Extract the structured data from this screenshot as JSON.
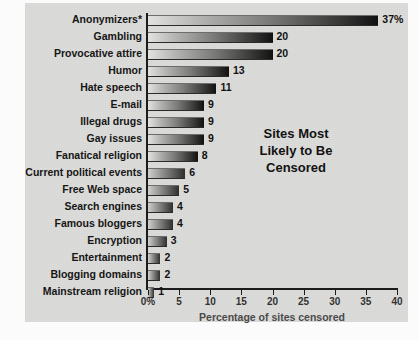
{
  "chart_data": {
    "type": "bar",
    "orientation": "horizontal",
    "title_lines": [
      "Sites Most",
      "Likely to Be",
      "Censored"
    ],
    "xlabel": "Percentage of sites censored",
    "ylabel": "",
    "xlim": [
      0,
      40
    ],
    "xticks": [
      0,
      5,
      10,
      15,
      20,
      25,
      30,
      35,
      40
    ],
    "xticklabels": [
      "0%",
      "5",
      "10",
      "15",
      "20",
      "25",
      "30",
      "35",
      "40"
    ],
    "grid": false,
    "legend": null,
    "categories": [
      "Anonymizers*",
      "Gambling",
      "Provocative attire",
      "Humor",
      "Hate speech",
      "E-mail",
      "Illegal drugs",
      "Gay issues",
      "Fanatical religion",
      "Current political events",
      "Free Web space",
      "Search engines",
      "Famous bloggers",
      "Encryption",
      "Entertainment",
      "Blogging domains",
      "Mainstream religion"
    ],
    "values": [
      37,
      20,
      20,
      13,
      11,
      9,
      9,
      9,
      8,
      6,
      5,
      4,
      4,
      3,
      2,
      2,
      1
    ],
    "value_labels": [
      "37%",
      "20",
      "20",
      "13",
      "11",
      "9",
      "9",
      "9",
      "8",
      "6",
      "5",
      "4",
      "4",
      "3",
      "2",
      "2",
      "1"
    ],
    "footnote": "* marks the Anonymizers category",
    "colors": {
      "panel_background": "#dcdcda",
      "bar_gradient_light": "#e2e2e0",
      "bar_gradient_dark": "#111111",
      "axis": "#1c1c1c",
      "label_text": "#161616",
      "tick_text": "#333333",
      "axis_title_text": "#4a4a4a"
    }
  }
}
